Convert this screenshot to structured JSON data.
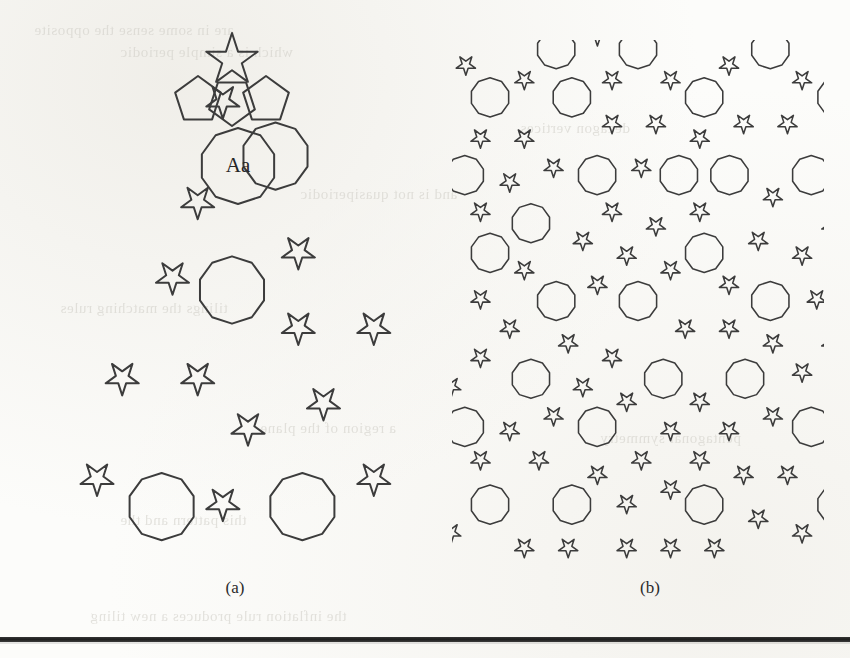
{
  "figure": {
    "kind": "two-panel-geometric-tiling-figure",
    "background_color": "#fcfcfa",
    "ink_color": "#3c3c3c",
    "panels": [
      {
        "id": "a",
        "caption": "(a)",
        "description": "Finite patch of a pentagonal (Penrose P1 type) tiling with a ragged outline, built from regular decagons, pentagons, rhombs and five-pointed stars",
        "label_text": "Aa",
        "label_note": "Aa labels the large decagon near the top of the patch",
        "apex_feature": "five-pointed-star",
        "tile_types": [
          "decagon",
          "pentagon",
          "thin-rhomb",
          "five-pointed-star",
          "boat"
        ],
        "outline": "ragged / scalloped",
        "stroke_width": 2.0,
        "rings": 3
      },
      {
        "id": "b",
        "caption": "(b)",
        "description": "Large rectangular patch of the same pentagonal quasiperiodic tiling, densely filled",
        "tile_types": [
          "decagon",
          "pentagon",
          "thin-rhomb",
          "five-pointed-star",
          "boat"
        ],
        "outline": "rectangular crop",
        "stroke_width": 1.55,
        "rings": 6
      }
    ],
    "captions": {
      "a": "(a)",
      "b": "(b)"
    },
    "rule": {
      "present": true,
      "color": "#101010",
      "thickness_px": 5
    },
    "bleedthrough": [
      {
        "text": "are in some sense the opposite",
        "x": 34,
        "y": 22
      },
      {
        "text": "which is a simple periodic",
        "x": 120,
        "y": 44
      },
      {
        "text": "and is not quasiperiodic",
        "x": 300,
        "y": 186
      },
      {
        "text": "tilings the matching rules",
        "x": 60,
        "y": 300
      },
      {
        "text": "a region of the plane",
        "x": 260,
        "y": 420
      },
      {
        "text": "this pattern and the",
        "x": 120,
        "y": 512
      },
      {
        "text": "the inflation rule produces a new tiling",
        "x": 90,
        "y": 608
      },
      {
        "text": "decagon vertices",
        "x": 520,
        "y": 120
      },
      {
        "text": "pentagonal symmetry",
        "x": 600,
        "y": 430
      }
    ]
  },
  "chart_data": {
    "type": "diagram",
    "title": "",
    "subtitle": "",
    "panels": [
      {
        "label": "(a)",
        "content": "finite patch of pentagonal tiling with star apex and decagon labelled Aa",
        "marked_tile": "Aa"
      },
      {
        "label": "(b)",
        "content": "extended rectangular patch of the same pentagonal tiling"
      }
    ]
  }
}
